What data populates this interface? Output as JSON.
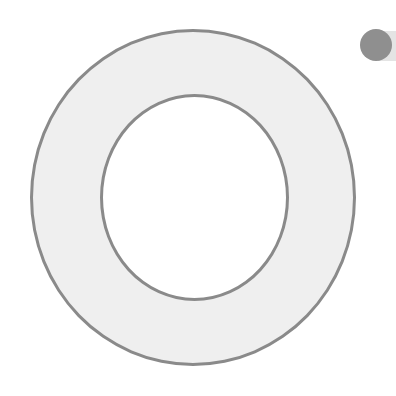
{
  "scene": {
    "description": "Large light-gray ring (donut) with gray outline and a small gray circle in the top-right corner",
    "colors": {
      "background": "#ffffff",
      "ring_fill": "#efefef",
      "ring_stroke": "#8a8a8a",
      "dot_fill": "#8f8f8f",
      "tab_fill": "#e4e4e4"
    },
    "shapes": [
      {
        "name": "ring",
        "type": "annulus"
      },
      {
        "name": "dot",
        "type": "circle"
      }
    ]
  }
}
